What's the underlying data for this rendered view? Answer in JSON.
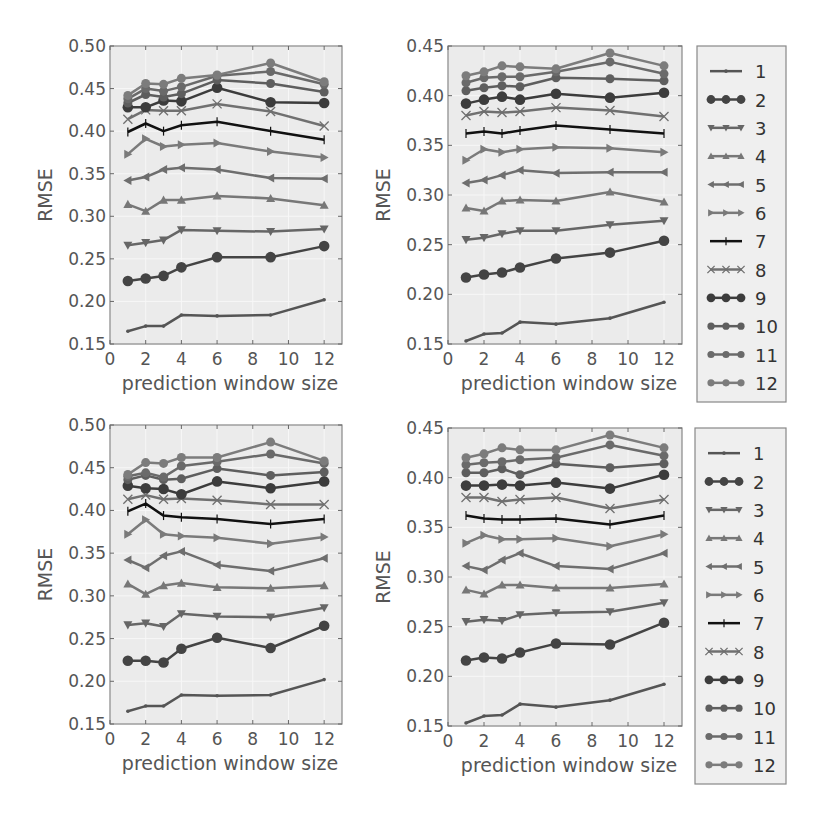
{
  "figure": {
    "background": "#ffffff",
    "plot_background": "#ebebeb",
    "frame_color": "#888888"
  },
  "chart_data": [
    {
      "type": "line",
      "panel": "top-left",
      "title": "",
      "xlabel": "prediction window size",
      "ylabel": "RMSE",
      "xlim": [
        0,
        13
      ],
      "ylim": [
        0.15,
        0.5
      ],
      "xticks": [
        0,
        2,
        4,
        6,
        8,
        10,
        12
      ],
      "yticks": [
        "0.15",
        "0.20",
        "0.25",
        "0.30",
        "0.35",
        "0.40",
        "0.45",
        "0.50"
      ],
      "grid": true,
      "legend_position": "none",
      "x": [
        1,
        2,
        3,
        4,
        6,
        9,
        12
      ],
      "series": [
        {
          "name": "1",
          "values": [
            0.165,
            0.171,
            0.171,
            0.184,
            0.183,
            0.184,
            0.202
          ]
        },
        {
          "name": "2",
          "values": [
            0.224,
            0.227,
            0.23,
            0.24,
            0.252,
            0.252,
            0.265
          ]
        },
        {
          "name": "3",
          "values": [
            0.266,
            0.269,
            0.272,
            0.284,
            0.283,
            0.282,
            0.285
          ]
        },
        {
          "name": "4",
          "values": [
            0.314,
            0.306,
            0.319,
            0.319,
            0.324,
            0.321,
            0.313
          ]
        },
        {
          "name": "5",
          "values": [
            0.342,
            0.346,
            0.355,
            0.357,
            0.355,
            0.345,
            0.344
          ]
        },
        {
          "name": "6",
          "values": [
            0.373,
            0.391,
            0.382,
            0.384,
            0.386,
            0.376,
            0.369
          ]
        },
        {
          "name": "7",
          "values": [
            0.399,
            0.409,
            0.4,
            0.407,
            0.411,
            0.4,
            0.39
          ]
        },
        {
          "name": "8",
          "values": [
            0.414,
            0.425,
            0.424,
            0.424,
            0.432,
            0.423,
            0.406
          ]
        },
        {
          "name": "9",
          "values": [
            0.428,
            0.428,
            0.436,
            0.435,
            0.451,
            0.434,
            0.433
          ]
        },
        {
          "name": "10",
          "values": [
            0.433,
            0.443,
            0.44,
            0.444,
            0.46,
            0.456,
            0.446
          ]
        },
        {
          "name": "11",
          "values": [
            0.438,
            0.45,
            0.447,
            0.452,
            0.465,
            0.47,
            0.455
          ]
        },
        {
          "name": "12",
          "values": [
            0.442,
            0.456,
            0.455,
            0.462,
            0.466,
            0.48,
            0.458
          ]
        }
      ]
    },
    {
      "type": "line",
      "panel": "top-right",
      "title": "",
      "xlabel": "prediction window size",
      "ylabel": "RMSE",
      "xlim": [
        0,
        13
      ],
      "ylim": [
        0.15,
        0.45
      ],
      "xticks": [
        0,
        2,
        4,
        6,
        8,
        10,
        12
      ],
      "yticks": [
        "0.15",
        "0.20",
        "0.25",
        "0.30",
        "0.35",
        "0.40",
        "0.45"
      ],
      "grid": true,
      "legend_position": "right",
      "x": [
        1,
        2,
        3,
        4,
        6,
        9,
        12
      ],
      "series": [
        {
          "name": "1",
          "values": [
            0.153,
            0.16,
            0.161,
            0.172,
            0.17,
            0.176,
            0.192
          ]
        },
        {
          "name": "2",
          "values": [
            0.217,
            0.22,
            0.222,
            0.227,
            0.236,
            0.242,
            0.254
          ]
        },
        {
          "name": "3",
          "values": [
            0.255,
            0.257,
            0.261,
            0.264,
            0.264,
            0.27,
            0.274
          ]
        },
        {
          "name": "4",
          "values": [
            0.287,
            0.284,
            0.294,
            0.295,
            0.294,
            0.303,
            0.293
          ]
        },
        {
          "name": "5",
          "values": [
            0.312,
            0.315,
            0.32,
            0.325,
            0.322,
            0.323,
            0.323
          ]
        },
        {
          "name": "6",
          "values": [
            0.335,
            0.346,
            0.343,
            0.346,
            0.348,
            0.347,
            0.343
          ]
        },
        {
          "name": "7",
          "values": [
            0.362,
            0.364,
            0.362,
            0.365,
            0.37,
            0.366,
            0.362
          ]
        },
        {
          "name": "8",
          "values": [
            0.38,
            0.384,
            0.383,
            0.384,
            0.388,
            0.385,
            0.379
          ]
        },
        {
          "name": "9",
          "values": [
            0.392,
            0.396,
            0.399,
            0.396,
            0.402,
            0.398,
            0.403
          ]
        },
        {
          "name": "10",
          "values": [
            0.405,
            0.408,
            0.41,
            0.409,
            0.418,
            0.417,
            0.415
          ]
        },
        {
          "name": "11",
          "values": [
            0.413,
            0.418,
            0.419,
            0.419,
            0.424,
            0.434,
            0.422
          ]
        },
        {
          "name": "12",
          "values": [
            0.42,
            0.424,
            0.43,
            0.429,
            0.427,
            0.443,
            0.43
          ]
        }
      ]
    },
    {
      "type": "line",
      "panel": "bottom-left",
      "title": "",
      "xlabel": "prediction window size",
      "ylabel": "RMSE",
      "xlim": [
        0,
        13
      ],
      "ylim": [
        0.15,
        0.5
      ],
      "xticks": [
        0,
        2,
        4,
        6,
        8,
        10,
        12
      ],
      "yticks": [
        "0.15",
        "0.20",
        "0.25",
        "0.30",
        "0.35",
        "0.40",
        "0.45",
        "0.50"
      ],
      "grid": true,
      "legend_position": "none",
      "x": [
        1,
        2,
        3,
        4,
        6,
        9,
        12
      ],
      "series": [
        {
          "name": "1",
          "values": [
            0.165,
            0.171,
            0.171,
            0.184,
            0.183,
            0.184,
            0.202
          ]
        },
        {
          "name": "2",
          "values": [
            0.224,
            0.224,
            0.222,
            0.238,
            0.251,
            0.239,
            0.265
          ]
        },
        {
          "name": "3",
          "values": [
            0.266,
            0.268,
            0.264,
            0.279,
            0.276,
            0.275,
            0.286
          ]
        },
        {
          "name": "4",
          "values": [
            0.314,
            0.302,
            0.312,
            0.315,
            0.31,
            0.309,
            0.312
          ]
        },
        {
          "name": "5",
          "values": [
            0.342,
            0.333,
            0.347,
            0.352,
            0.336,
            0.329,
            0.344
          ]
        },
        {
          "name": "6",
          "values": [
            0.372,
            0.389,
            0.372,
            0.37,
            0.368,
            0.361,
            0.369
          ]
        },
        {
          "name": "7",
          "values": [
            0.399,
            0.408,
            0.394,
            0.392,
            0.39,
            0.384,
            0.39
          ]
        },
        {
          "name": "8",
          "values": [
            0.413,
            0.418,
            0.413,
            0.414,
            0.412,
            0.407,
            0.407
          ]
        },
        {
          "name": "9",
          "values": [
            0.429,
            0.426,
            0.425,
            0.419,
            0.434,
            0.426,
            0.434
          ]
        },
        {
          "name": "10",
          "values": [
            0.436,
            0.441,
            0.436,
            0.437,
            0.449,
            0.441,
            0.445
          ]
        },
        {
          "name": "11",
          "values": [
            0.44,
            0.444,
            0.439,
            0.452,
            0.457,
            0.466,
            0.455
          ]
        },
        {
          "name": "12",
          "values": [
            0.442,
            0.456,
            0.455,
            0.462,
            0.462,
            0.48,
            0.458
          ]
        }
      ]
    },
    {
      "type": "line",
      "panel": "bottom-right",
      "title": "",
      "xlabel": "prediction window size",
      "ylabel": "RMSE",
      "xlim": [
        0,
        13
      ],
      "ylim": [
        0.15,
        0.45
      ],
      "xticks": [
        0,
        2,
        4,
        6,
        8,
        10,
        12
      ],
      "yticks": [
        "0.15",
        "0.20",
        "0.25",
        "0.30",
        "0.35",
        "0.40",
        "0.45"
      ],
      "grid": true,
      "legend_position": "right",
      "x": [
        1,
        2,
        3,
        4,
        6,
        9,
        12
      ],
      "series": [
        {
          "name": "1",
          "values": [
            0.153,
            0.16,
            0.161,
            0.172,
            0.169,
            0.176,
            0.192
          ]
        },
        {
          "name": "2",
          "values": [
            0.216,
            0.219,
            0.218,
            0.224,
            0.233,
            0.232,
            0.254
          ]
        },
        {
          "name": "3",
          "values": [
            0.255,
            0.257,
            0.256,
            0.262,
            0.264,
            0.265,
            0.274
          ]
        },
        {
          "name": "4",
          "values": [
            0.287,
            0.283,
            0.292,
            0.292,
            0.289,
            0.289,
            0.293
          ]
        },
        {
          "name": "5",
          "values": [
            0.311,
            0.307,
            0.317,
            0.324,
            0.311,
            0.308,
            0.324
          ]
        },
        {
          "name": "6",
          "values": [
            0.334,
            0.342,
            0.338,
            0.338,
            0.339,
            0.331,
            0.343
          ]
        },
        {
          "name": "7",
          "values": [
            0.362,
            0.359,
            0.358,
            0.358,
            0.359,
            0.353,
            0.362
          ]
        },
        {
          "name": "8",
          "values": [
            0.38,
            0.38,
            0.376,
            0.378,
            0.38,
            0.369,
            0.378
          ]
        },
        {
          "name": "9",
          "values": [
            0.392,
            0.392,
            0.393,
            0.392,
            0.395,
            0.389,
            0.403
          ]
        },
        {
          "name": "10",
          "values": [
            0.405,
            0.405,
            0.409,
            0.403,
            0.414,
            0.41,
            0.414
          ]
        },
        {
          "name": "11",
          "values": [
            0.413,
            0.415,
            0.416,
            0.418,
            0.42,
            0.433,
            0.422
          ]
        },
        {
          "name": "12",
          "values": [
            0.42,
            0.424,
            0.43,
            0.428,
            0.428,
            0.443,
            0.43
          ]
        }
      ]
    }
  ],
  "legend": {
    "entries": [
      {
        "label": "1",
        "marker": "point",
        "color": "#555555",
        "width": 2.5
      },
      {
        "label": "2",
        "marker": "circle",
        "color": "#444444",
        "width": 2.5
      },
      {
        "label": "3",
        "marker": "triangle-down",
        "color": "#666666",
        "width": 2.5
      },
      {
        "label": "4",
        "marker": "triangle-up",
        "color": "#777777",
        "width": 2.5
      },
      {
        "label": "5",
        "marker": "triangle-left",
        "color": "#6e6e6e",
        "width": 2.5
      },
      {
        "label": "6",
        "marker": "triangle-right",
        "color": "#7a7a7a",
        "width": 2.5
      },
      {
        "label": "7",
        "marker": "vline",
        "color": "#111111",
        "width": 2.5
      },
      {
        "label": "8",
        "marker": "x",
        "color": "#707070",
        "width": 2.5
      },
      {
        "label": "9",
        "marker": "circle",
        "color": "#3c3c3c",
        "width": 2.5
      },
      {
        "label": "10",
        "marker": "circle-small",
        "color": "#5e5e5e",
        "width": 2.5
      },
      {
        "label": "11",
        "marker": "circle-small",
        "color": "#6a6a6a",
        "width": 2.5
      },
      {
        "label": "12",
        "marker": "circle-small",
        "color": "#7c7c7c",
        "width": 2.5
      }
    ]
  },
  "layout": {
    "panels": [
      {
        "x0": 110,
        "y0": 46,
        "x1": 342,
        "y1": 344
      },
      {
        "x0": 448,
        "y0": 46,
        "x1": 682,
        "y1": 344
      },
      {
        "x0": 110,
        "y0": 425,
        "x1": 342,
        "y1": 724
      },
      {
        "x0": 448,
        "y0": 428,
        "x1": 682,
        "y1": 726
      }
    ],
    "legends": [
      {
        "x0": 697,
        "y0": 46,
        "x1": 786,
        "y1": 402
      },
      {
        "x0": 695,
        "y0": 428,
        "x1": 786,
        "y1": 784
      }
    ]
  }
}
